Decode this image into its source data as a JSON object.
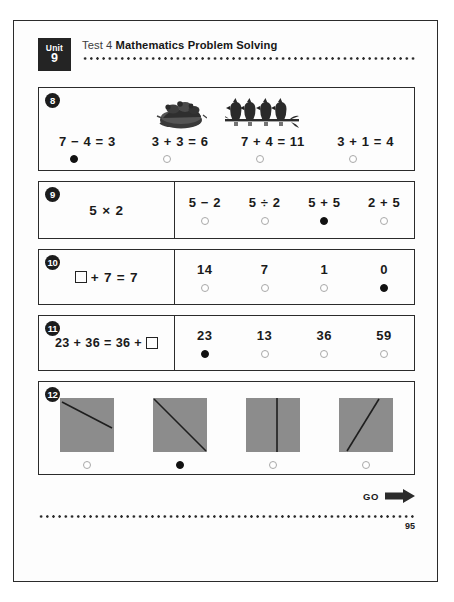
{
  "header": {
    "unit_word": "Unit",
    "unit_number": "9",
    "test_label": "Test 4",
    "title": "Mathematics Problem Solving"
  },
  "questions": [
    {
      "number": "8",
      "layout": "image-options",
      "artwork": [
        "bird-nest-illustration",
        "four-birds-on-branch-illustration"
      ],
      "options": [
        {
          "text": "7 − 4 = 3",
          "selected": true
        },
        {
          "text": "3 + 3 = 6",
          "selected": false
        },
        {
          "text": "7 + 4 = 11",
          "selected": false
        },
        {
          "text": "3 + 1 = 4",
          "selected": false
        }
      ]
    },
    {
      "number": "9",
      "layout": "prompt-options",
      "prompt": "5 × 2",
      "options": [
        {
          "text": "5 − 2",
          "selected": false
        },
        {
          "text": "5 ÷ 2",
          "selected": false
        },
        {
          "text": "5 + 5",
          "selected": true
        },
        {
          "text": "2 + 5",
          "selected": false
        }
      ]
    },
    {
      "number": "10",
      "layout": "prompt-options",
      "prompt_prefix": "",
      "prompt_suffix": "+ 7 = 7",
      "has_blank": true,
      "blank_position": "start",
      "options": [
        {
          "text": "14",
          "selected": false
        },
        {
          "text": "7",
          "selected": false
        },
        {
          "text": "1",
          "selected": false
        },
        {
          "text": "0",
          "selected": true
        }
      ]
    },
    {
      "number": "11",
      "layout": "prompt-options",
      "prompt_prefix": "23 + 36 = 36 +",
      "prompt_suffix": "",
      "has_blank": true,
      "blank_position": "end",
      "options": [
        {
          "text": "23",
          "selected": true
        },
        {
          "text": "13",
          "selected": false
        },
        {
          "text": "36",
          "selected": false
        },
        {
          "text": "59",
          "selected": false
        }
      ]
    },
    {
      "number": "12",
      "layout": "shape-options",
      "options": [
        {
          "shape": "square-with-shallow-diagonal-line",
          "selected": false
        },
        {
          "shape": "square-with-corner-to-corner-diagonal-line",
          "selected": true
        },
        {
          "shape": "square-with-off-center-vertical-line",
          "selected": false
        },
        {
          "shape": "square-with-steep-slanted-line",
          "selected": false
        }
      ]
    }
  ],
  "footer": {
    "go_label": "GO",
    "page_number": "95"
  },
  "colors": {
    "ink": "#1a1a1a",
    "badge_bg": "#242424",
    "shape_gray": "#8c8c8c",
    "radio_empty_border": "#a9a9a9",
    "radio_filled": "#111111"
  }
}
